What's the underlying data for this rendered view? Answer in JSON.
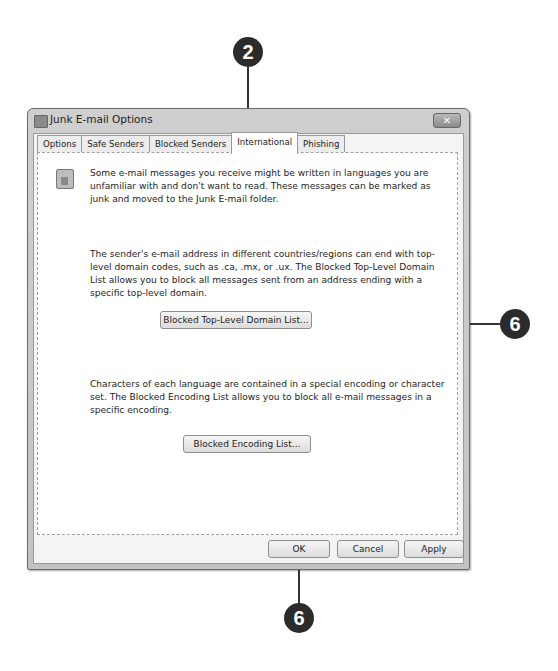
{
  "callouts": [
    {
      "number": "2"
    },
    {
      "number": "3"
    },
    {
      "number": "6"
    }
  ],
  "window": {
    "title": "Junk E-mail Options",
    "close_glyph": "✕"
  },
  "tabs": [
    {
      "label": "Options",
      "active": false
    },
    {
      "label": "Safe Senders",
      "active": false
    },
    {
      "label": "Blocked Senders",
      "active": false
    },
    {
      "label": "International",
      "active": true
    },
    {
      "label": "Phishing",
      "active": false
    }
  ],
  "panel": {
    "intro": "Some e-mail messages you receive might be written in languages you are unfamiliar with and don't want to read.  These messages can be marked as junk and moved to the Junk E-mail folder.",
    "domain_text": "The sender's e-mail address in different countries/regions can end with top-level domain codes, such as .ca, .mx, or .ux.  The Blocked Top-Level Domain List allows you to block all messages sent from an address ending with a specific top-level domain.",
    "domain_button": "Blocked Top-Level Domain List...",
    "encoding_text": "Characters of each language are contained in a special encoding or character set.  The Blocked Encoding List allows you to block all e-mail messages in a specific encoding.",
    "encoding_button": "Blocked Encoding List..."
  },
  "footer": {
    "ok": "OK",
    "cancel": "Cancel",
    "apply": "Apply"
  }
}
